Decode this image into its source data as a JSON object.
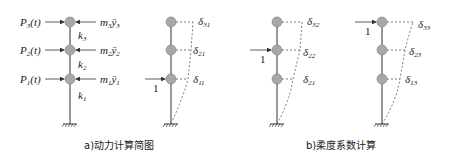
{
  "figure": {
    "part_a": {
      "caption": "a)动力计算简图",
      "loads": [
        {
          "label": "P",
          "sub": "3",
          "suffix": "(t)"
        },
        {
          "label": "P",
          "sub": "2",
          "suffix": "(t)"
        },
        {
          "label": "P",
          "sub": "1",
          "suffix": "(t)"
        }
      ],
      "inertia": [
        {
          "mass": "m",
          "msub": "3",
          "acc": "ÿ",
          "asub": "3"
        },
        {
          "mass": "m",
          "msub": "2",
          "acc": "ÿ",
          "asub": "2"
        },
        {
          "mass": "m",
          "msub": "1",
          "acc": "ÿ",
          "asub": "1"
        }
      ],
      "stiffness": [
        {
          "label": "k",
          "sub": "3"
        },
        {
          "label": "k",
          "sub": "2"
        },
        {
          "label": "k",
          "sub": "1"
        }
      ]
    },
    "part_b": {
      "caption": "b)柔度系数计算",
      "unit_load_label": "1",
      "cases": [
        {
          "load_level": 1,
          "deltas": [
            {
              "s": "δ",
              "sub": "31"
            },
            {
              "s": "δ",
              "sub": "21"
            },
            {
              "s": "δ",
              "sub": "11"
            }
          ]
        },
        {
          "load_level": 2,
          "deltas": [
            {
              "s": "δ",
              "sub": "32"
            },
            {
              "s": "δ",
              "sub": "22"
            },
            {
              "s": "δ",
              "sub": "21"
            }
          ]
        },
        {
          "load_level": 3,
          "deltas": [
            {
              "s": "δ",
              "sub": "33"
            },
            {
              "s": "δ",
              "sub": "23"
            },
            {
              "s": "δ",
              "sub": "13"
            }
          ]
        }
      ]
    },
    "colors": {
      "node_fill": "#a8a8a8",
      "line": "#333333",
      "text": "#222222"
    }
  }
}
